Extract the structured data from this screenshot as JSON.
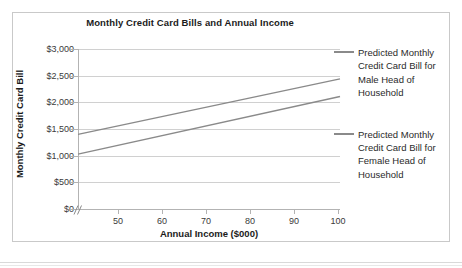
{
  "chart_data": {
    "type": "line",
    "title": "Monthly Credit Card Bills and Annual Income",
    "xlabel": "Annual Income ($000)",
    "ylabel": "Monthly Credit Card Bill",
    "xlim": [
      43,
      100
    ],
    "ylim": [
      0,
      3000
    ],
    "xticks": [
      50,
      60,
      70,
      80,
      90,
      100
    ],
    "xtick_labels": [
      "50",
      "60",
      "70",
      "80",
      "90",
      "100"
    ],
    "yticks": [
      0,
      500,
      1000,
      1500,
      2000,
      2500,
      3000
    ],
    "ytick_labels": [
      "$0",
      "$500",
      "$1,000",
      "$1,500",
      "$2,000",
      "$2,500",
      "$3,000"
    ],
    "grid": "horizontal",
    "axis_break": true,
    "legend_position": "right",
    "line_color": "#8a8a8a",
    "series": [
      {
        "name": "Predicted Monthly Credit Card Bill for Male Head of Household",
        "x": [
          43,
          100
        ],
        "values": [
          1400,
          2440
        ]
      },
      {
        "name": "Predicted Monthly Credit Card Bill for Female Head of Household",
        "x": [
          43,
          100
        ],
        "values": [
          1030,
          2110
        ]
      }
    ]
  },
  "legend": {
    "entries": [
      {
        "label": "Predicted Monthly Credit Card Bill for Male Head of Household"
      },
      {
        "label": "Predicted Monthly Credit Card Bill for Female Head of Household"
      }
    ]
  }
}
